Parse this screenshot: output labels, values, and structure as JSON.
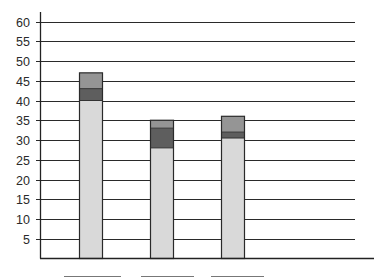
{
  "chart_data": {
    "type": "bar",
    "stacked": true,
    "title": "",
    "xlabel": "",
    "ylabel": "",
    "categories": [
      "",
      "",
      ""
    ],
    "series": [
      {
        "name": "segment-1 (light)",
        "color": "#d9d9d9",
        "values": [
          40,
          28,
          30.5
        ]
      },
      {
        "name": "segment-2 (dark)",
        "color": "#5e5e5e",
        "values": [
          3,
          5,
          1.5
        ]
      },
      {
        "name": "segment-3 (medium)",
        "color": "#959595",
        "values": [
          4,
          2,
          4
        ]
      }
    ],
    "totals": [
      47,
      35,
      36
    ],
    "ylim": [
      0,
      60
    ],
    "yticks": [
      5,
      10,
      15,
      20,
      25,
      30,
      35,
      40,
      45,
      50,
      55,
      60
    ],
    "grid": true,
    "legend": {
      "visible": false
    },
    "category_label_boxes": 3
  }
}
